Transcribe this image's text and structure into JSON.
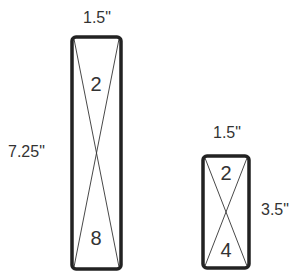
{
  "diagram": {
    "large_block": {
      "width_label": "1.5\"",
      "height_label": "7.25\"",
      "top_number": "2",
      "bottom_number": "8"
    },
    "small_block": {
      "width_label": "1.5\"",
      "height_label": "3.5\"",
      "top_number": "2",
      "bottom_number": "4"
    },
    "colors": {
      "outline": "#222222",
      "text": "#333333"
    }
  }
}
